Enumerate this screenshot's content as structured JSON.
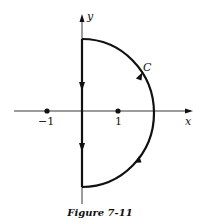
{
  "figure": {
    "caption": "Figure 7-11",
    "axes": {
      "x_label": "x",
      "y_label": "y"
    },
    "points": [
      {
        "label": "−1",
        "value": -1
      },
      {
        "label": "1",
        "value": 1
      }
    ],
    "contour": {
      "label": "C",
      "shape": "right semicircle closed by imaginary-axis segment",
      "orientation": "counterclockwise"
    },
    "colors": {
      "ink": "#111111",
      "background": "#ffffff"
    }
  }
}
